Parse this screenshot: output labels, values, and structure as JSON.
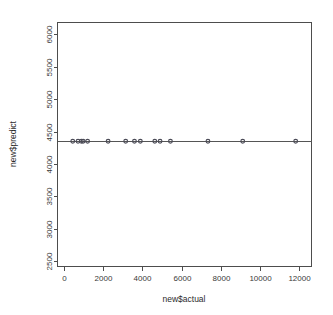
{
  "chart_data": {
    "type": "scatter",
    "title": "",
    "xlabel": "new$actual",
    "ylabel": "new$predict",
    "xlim": [
      -350,
      12650
    ],
    "ylim": [
      2420,
      6180
    ],
    "xticks": [
      0,
      2000,
      4000,
      6000,
      8000,
      10000,
      12000
    ],
    "yticks": [
      2500,
      3000,
      3500,
      4000,
      4500,
      5000,
      5500,
      6000
    ],
    "xticklabels": [
      "0",
      "2000",
      "4000",
      "6000",
      "8000",
      "10000",
      "12000"
    ],
    "yticklabels": [
      "2500",
      "3000",
      "3500",
      "4000",
      "4500",
      "5000",
      "5500",
      "6000"
    ],
    "grid": false,
    "legend": null,
    "point_color": "#4a4a56",
    "line_color": "#555555",
    "frame_color": "#4d4d4d",
    "background": "#ffffff",
    "constant_prediction": 4350,
    "x": [
      430,
      700,
      870,
      960,
      1190,
      2240,
      3140,
      3590,
      3890,
      4630,
      4900,
      5430,
      7350,
      9130,
      11840
    ],
    "y": [
      4350,
      4350,
      4350,
      4350,
      4350,
      4350,
      4350,
      4350,
      4350,
      4350,
      4350,
      4350,
      4350,
      4350,
      4350
    ],
    "series": [
      {
        "name": "new$predict vs new$actual",
        "x": [
          430,
          700,
          870,
          960,
          1190,
          2240,
          3140,
          3590,
          3890,
          4630,
          4900,
          5430,
          7350,
          9130,
          11840
        ],
        "values": [
          4350,
          4350,
          4350,
          4350,
          4350,
          4350,
          4350,
          4350,
          4350,
          4350,
          4350,
          4350,
          4350,
          4350,
          4350
        ]
      }
    ],
    "reference_line": {
      "type": "horizontal",
      "y": 4350,
      "x_start": -350,
      "x_end": 12650
    }
  }
}
